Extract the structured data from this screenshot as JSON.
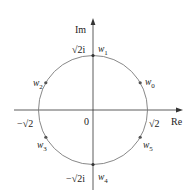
{
  "diagram": {
    "type": "complex-plane-roots",
    "colors": {
      "axis": "#333333",
      "circle": "#7a7a7a",
      "point": "#555555",
      "text": "#222222"
    },
    "axes": {
      "x_label": "Re",
      "y_label": "Im",
      "origin_label": "0"
    },
    "radius_labels": {
      "pos_real": "√2",
      "neg_real": "−√2",
      "pos_imag": "√2i",
      "neg_imag": "−√2i"
    },
    "points": [
      {
        "name": "w",
        "sub": "0",
        "angle_deg": 30
      },
      {
        "name": "w",
        "sub": "1",
        "angle_deg": 90
      },
      {
        "name": "w",
        "sub": "2",
        "angle_deg": 150
      },
      {
        "name": "w",
        "sub": "3",
        "angle_deg": 210
      },
      {
        "name": "w",
        "sub": "4",
        "angle_deg": 270
      },
      {
        "name": "w",
        "sub": "5",
        "angle_deg": 330
      }
    ]
  }
}
